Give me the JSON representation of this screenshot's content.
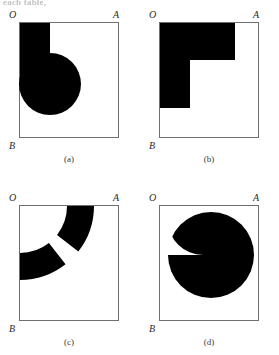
{
  "figure": {
    "top_text_remnant": "each table,",
    "background_color": "#ffffff",
    "fill_color": "#000000",
    "frame_color": "#6f6f6f",
    "label_color": "#2b2b2b",
    "panels": [
      {
        "id": "a",
        "caption": "(a)",
        "corner_labels": {
          "origin": "O",
          "right": "A",
          "bottom": "B"
        },
        "shape_description": "vertical bar from top edge with circle at lower end"
      },
      {
        "id": "b",
        "caption": "(b)",
        "corner_labels": {
          "origin": "O",
          "right": "A",
          "bottom": "B"
        },
        "shape_description": "L-shaped region along top and left edges"
      },
      {
        "id": "c",
        "caption": "(c)",
        "corner_labels": {
          "origin": "O",
          "right": "A",
          "bottom": "B"
        },
        "shape_description": "quarter annulus centered at O split by radial gap"
      },
      {
        "id": "d",
        "caption": "(d)",
        "corner_labels": {
          "origin": "O",
          "right": "A",
          "bottom": "B"
        },
        "shape_description": "disk with concave quarter-circle notch at upper left"
      }
    ]
  }
}
